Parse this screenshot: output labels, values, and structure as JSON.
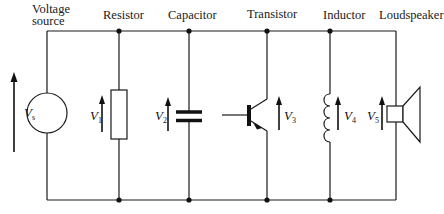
{
  "diagram": {
    "type": "parallel-circuit",
    "components": [
      {
        "id": "voltage_source",
        "label_line1": "Voltage",
        "label_line2": "source",
        "voltage_symbol": "V",
        "voltage_subscript": "s"
      },
      {
        "id": "resistor",
        "label": "Resistor",
        "voltage_symbol": "V",
        "voltage_subscript": "1"
      },
      {
        "id": "capacitor",
        "label": "Capacitor",
        "voltage_symbol": "V",
        "voltage_subscript": "2"
      },
      {
        "id": "transistor",
        "label": "Transistor",
        "voltage_symbol": "V",
        "voltage_subscript": "3"
      },
      {
        "id": "inductor",
        "label": "Inductor",
        "voltage_symbol": "V",
        "voltage_subscript": "4"
      },
      {
        "id": "loudspeaker",
        "label": "Loudspeaker",
        "voltage_symbol": "V",
        "voltage_subscript": "5"
      }
    ],
    "colors": {
      "line": "#1a1a1a",
      "background": "#ffffff"
    }
  }
}
